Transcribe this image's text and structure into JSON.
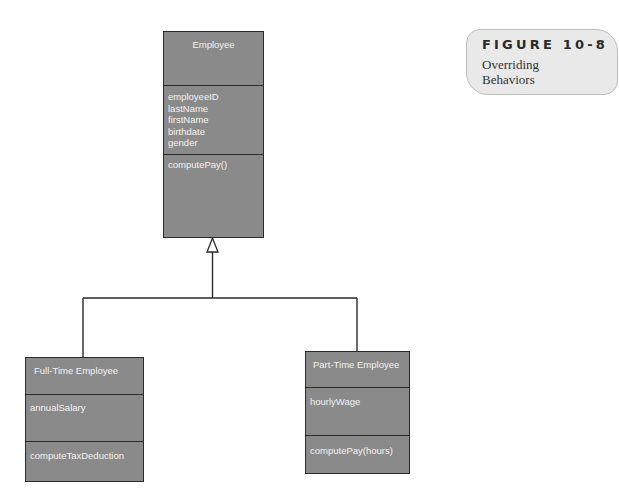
{
  "figure": {
    "number": "FIGURE 10-8",
    "caption_line1": "Overriding",
    "caption_line2": "Behaviors"
  },
  "classes": {
    "employee": {
      "name": "Employee",
      "attributes": [
        "employeeID",
        "lastName",
        "firstName",
        "birthdate",
        "gender"
      ],
      "methods": [
        "computePay()"
      ]
    },
    "full_time": {
      "name": "Full-Time Employee",
      "attributes": [
        "annualSalary"
      ],
      "methods": [
        "computeTaxDeduction"
      ]
    },
    "part_time": {
      "name": "Part-Time Employee",
      "attributes": [
        "hourlyWage"
      ],
      "methods": [
        "computePay(hours)"
      ]
    }
  },
  "relationships": [
    {
      "type": "generalization",
      "from": "Full-Time Employee",
      "to": "Employee"
    },
    {
      "type": "generalization",
      "from": "Part-Time Employee",
      "to": "Employee"
    }
  ],
  "colors": {
    "class_fill": "#8a8a8a",
    "class_border": "#2a2a2a",
    "class_text": "#f2f2f2",
    "label_fill": "#e9e9e9"
  }
}
